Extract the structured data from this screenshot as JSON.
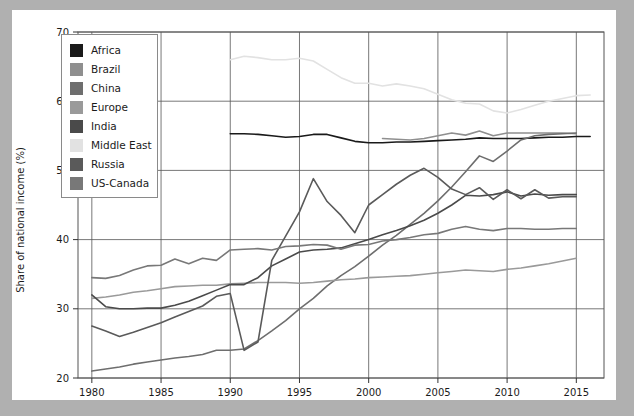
{
  "chart_data": {
    "type": "line",
    "title": "",
    "xlabel": "",
    "ylabel": "Share of national income (%)",
    "xlim": [
      1979,
      2017
    ],
    "ylim": [
      20,
      70
    ],
    "xticks": [
      1980,
      1985,
      1990,
      1995,
      2000,
      2005,
      2010,
      2015
    ],
    "yticks": [
      20,
      30,
      40,
      50,
      60,
      70
    ],
    "grid": true,
    "legend_position": "upper-left-inside",
    "series": [
      {
        "name": "Africa",
        "color": "#1a1a1a",
        "x": [
          1990,
          1991,
          1992,
          1993,
          1994,
          1995,
          1996,
          1997,
          1998,
          1999,
          2000,
          2001,
          2002,
          2003,
          2004,
          2005,
          2006,
          2007,
          2008,
          2009,
          2010,
          2011,
          2012,
          2013,
          2014,
          2015,
          2016
        ],
        "values": [
          55.3,
          55.3,
          55.2,
          55.0,
          54.8,
          54.9,
          55.2,
          55.2,
          54.7,
          54.2,
          54.0,
          54.0,
          54.1,
          54.1,
          54.2,
          54.3,
          54.4,
          54.5,
          54.7,
          54.6,
          54.6,
          54.6,
          54.7,
          54.8,
          54.8,
          54.9,
          54.9
        ]
      },
      {
        "name": "Brazil",
        "color": "#8f8f8f",
        "x": [
          2001,
          2002,
          2003,
          2004,
          2005,
          2006,
          2007,
          2008,
          2009,
          2010,
          2011,
          2012,
          2013,
          2014,
          2015
        ],
        "values": [
          54.6,
          54.5,
          54.4,
          54.6,
          55.0,
          55.4,
          55.1,
          55.7,
          55.0,
          55.4,
          55.4,
          55.4,
          55.4,
          55.4,
          55.3
        ]
      },
      {
        "name": "China",
        "color": "#6e6e6e",
        "x": [
          1980,
          1981,
          1982,
          1983,
          1984,
          1985,
          1986,
          1987,
          1988,
          1989,
          1990,
          1991,
          1992,
          1993,
          1994,
          1995,
          1996,
          1997,
          1998,
          1999,
          2000,
          2001,
          2002,
          2003,
          2004,
          2005,
          2006,
          2007,
          2008,
          2009,
          2010,
          2011,
          2012,
          2013,
          2014,
          2015
        ],
        "values": [
          21.0,
          21.3,
          21.6,
          22.0,
          22.3,
          22.6,
          22.9,
          23.1,
          23.4,
          24.0,
          24.0,
          24.2,
          25.4,
          26.8,
          28.3,
          30.0,
          31.5,
          33.3,
          34.8,
          36.1,
          37.6,
          39.2,
          40.6,
          42.2,
          43.8,
          45.6,
          47.6,
          49.8,
          52.1,
          51.3,
          52.8,
          54.4,
          55.0,
          55.2,
          55.3,
          55.4
        ]
      },
      {
        "name": "Europe",
        "color": "#9a9a9a",
        "x": [
          1980,
          1981,
          1982,
          1983,
          1984,
          1985,
          1986,
          1987,
          1988,
          1989,
          1990,
          1991,
          1992,
          1993,
          1994,
          1995,
          1996,
          1997,
          1998,
          1999,
          2000,
          2001,
          2002,
          2003,
          2004,
          2005,
          2006,
          2007,
          2008,
          2009,
          2010,
          2011,
          2012,
          2013,
          2014,
          2015
        ],
        "values": [
          31.5,
          31.7,
          32.0,
          32.4,
          32.6,
          32.9,
          33.2,
          33.3,
          33.4,
          33.4,
          33.6,
          33.7,
          33.8,
          33.8,
          33.8,
          33.7,
          33.8,
          34.0,
          34.2,
          34.3,
          34.5,
          34.6,
          34.7,
          34.8,
          35.0,
          35.2,
          35.4,
          35.6,
          35.5,
          35.4,
          35.7,
          35.9,
          36.2,
          36.5,
          36.9,
          37.3
        ]
      },
      {
        "name": "India",
        "color": "#4a4a4a",
        "x": [
          1980,
          1981,
          1982,
          1983,
          1984,
          1985,
          1986,
          1987,
          1988,
          1989,
          1990,
          1991,
          1992,
          1993,
          1994,
          1995,
          1996,
          1997,
          1998,
          1999,
          2000,
          2001,
          2002,
          2003,
          2004,
          2005,
          2006,
          2007,
          2008,
          2009,
          2010,
          2011,
          2012,
          2013,
          2014,
          2015
        ],
        "values": [
          32.0,
          30.3,
          30.0,
          30.0,
          30.1,
          30.1,
          30.5,
          31.1,
          31.9,
          32.7,
          33.5,
          33.5,
          34.5,
          36.2,
          37.2,
          38.2,
          38.5,
          38.6,
          38.8,
          39.4,
          40.0,
          40.7,
          41.3,
          42.0,
          42.8,
          43.8,
          45.0,
          46.4,
          46.3,
          46.5,
          46.9,
          46.3,
          46.6,
          46.4,
          46.5,
          46.5
        ]
      },
      {
        "name": "Middle East",
        "color": "#e2e2e2",
        "x": [
          1990,
          1991,
          1992,
          1993,
          1994,
          1995,
          1996,
          1997,
          1998,
          1999,
          2000,
          2001,
          2002,
          2003,
          2004,
          2005,
          2006,
          2007,
          2008,
          2009,
          2010,
          2011,
          2012,
          2013,
          2014,
          2015,
          2016
        ],
        "values": [
          66.0,
          66.5,
          66.3,
          66.0,
          66.0,
          66.2,
          65.8,
          64.6,
          63.4,
          62.6,
          62.6,
          62.2,
          62.5,
          62.2,
          61.8,
          61.0,
          60.2,
          59.7,
          59.6,
          58.6,
          58.3,
          58.8,
          59.4,
          60.0,
          60.4,
          60.8,
          60.9
        ]
      },
      {
        "name": "Russia",
        "color": "#5a5a5a",
        "x": [
          1980,
          1981,
          1982,
          1983,
          1984,
          1985,
          1986,
          1987,
          1988,
          1989,
          1990,
          1991,
          1992,
          1993,
          1994,
          1995,
          1996,
          1997,
          1998,
          1999,
          2000,
          2001,
          2002,
          2003,
          2004,
          2005,
          2006,
          2007,
          2008,
          2009,
          2010,
          2011,
          2012,
          2013,
          2014,
          2015
        ],
        "values": [
          27.5,
          26.8,
          26.0,
          26.6,
          27.3,
          28.0,
          28.8,
          29.6,
          30.4,
          31.8,
          32.2,
          24.0,
          25.2,
          37.0,
          40.5,
          44.0,
          48.8,
          45.5,
          43.5,
          41.0,
          45.0,
          46.5,
          48.0,
          49.3,
          50.3,
          49.0,
          47.3,
          46.5,
          47.5,
          45.8,
          47.2,
          45.9,
          47.2,
          46.0,
          46.2,
          46.2
        ]
      },
      {
        "name": "US-Canada",
        "color": "#787878",
        "x": [
          1980,
          1981,
          1982,
          1983,
          1984,
          1985,
          1986,
          1987,
          1988,
          1989,
          1990,
          1991,
          1992,
          1993,
          1994,
          1995,
          1996,
          1997,
          1998,
          1999,
          2000,
          2001,
          2002,
          2003,
          2004,
          2005,
          2006,
          2007,
          2008,
          2009,
          2010,
          2011,
          2012,
          2013,
          2014,
          2015
        ],
        "values": [
          34.5,
          34.4,
          34.8,
          35.6,
          36.2,
          36.3,
          37.2,
          36.5,
          37.3,
          37.0,
          38.5,
          38.6,
          38.7,
          38.5,
          39.0,
          39.1,
          39.3,
          39.2,
          38.6,
          39.2,
          39.3,
          39.8,
          40.0,
          40.3,
          40.7,
          40.9,
          41.5,
          41.9,
          41.5,
          41.3,
          41.6,
          41.6,
          41.5,
          41.5,
          41.6,
          41.6
        ]
      }
    ]
  },
  "legend": {
    "items": [
      {
        "label": "Africa",
        "color": "#1a1a1a"
      },
      {
        "label": "Brazil",
        "color": "#8f8f8f"
      },
      {
        "label": "China",
        "color": "#6e6e6e"
      },
      {
        "label": "Europe",
        "color": "#9a9a9a"
      },
      {
        "label": "India",
        "color": "#4a4a4a"
      },
      {
        "label": "Middle East",
        "color": "#e2e2e2"
      },
      {
        "label": "Russia",
        "color": "#5a5a5a"
      },
      {
        "label": "US-Canada",
        "color": "#787878"
      }
    ]
  },
  "colors": {
    "page_background": "#b0b0b0",
    "figure_background": "#ffffff",
    "grid": "#555555",
    "text": "#1b1b1b"
  }
}
